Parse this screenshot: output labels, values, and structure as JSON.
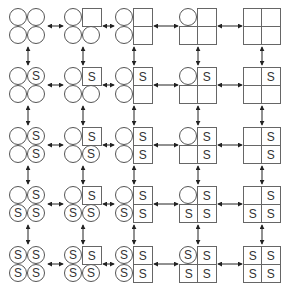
{
  "diagram": {
    "label_text": "S",
    "colors": {
      "stroke": "#555555",
      "arrow": "#222222",
      "text": "#333333",
      "background": "#ffffff"
    },
    "column_x": [
      9,
      64,
      115,
      179,
      243
    ],
    "row_y": [
      8,
      67,
      127,
      186,
      246
    ],
    "shape_pattern_by_column": [
      {
        "tl": "circle",
        "tr": "circle",
        "bl": "circle",
        "br": "circle"
      },
      {
        "tl": "circle",
        "tr": "square",
        "bl": "circle",
        "br": "circle"
      },
      {
        "tl": "circle",
        "tr": "square",
        "bl": "circle",
        "br": "square"
      },
      {
        "tl": "circle",
        "tr": "square",
        "bl": "square",
        "br": "square"
      },
      {
        "tl": "square",
        "tr": "square",
        "bl": "square",
        "br": "square"
      }
    ],
    "label_pattern_by_row": [
      {
        "tl": "",
        "tr": "",
        "bl": "",
        "br": ""
      },
      {
        "tl": "",
        "tr": "S",
        "bl": "",
        "br": ""
      },
      {
        "tl": "",
        "tr": "S",
        "bl": "",
        "br": "S"
      },
      {
        "tl": "",
        "tr": "S",
        "bl": "S",
        "br": "S"
      },
      {
        "tl": "S",
        "tr": "S",
        "bl": "S",
        "br": "S"
      }
    ],
    "arrows": {
      "horizontal": "bidirectional between every adjacent column pair in each row",
      "vertical": "bidirectional between every adjacent row pair in each column"
    }
  }
}
